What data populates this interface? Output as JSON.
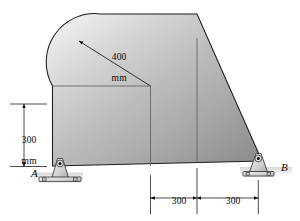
{
  "figure": {
    "kind": "engineering-statics-diagram"
  },
  "dimensions": {
    "radius": {
      "value": "400",
      "unit": "mm",
      "line1": "400",
      "line2": "mm",
      "type": "radius-leader"
    },
    "height_left": {
      "value": "300",
      "unit": "mm",
      "line1": "300",
      "line2": "mm",
      "type": "vertical"
    },
    "span_left": {
      "value": "300",
      "unit": "mm",
      "line1": "300",
      "line2": "mm",
      "type": "horizontal"
    },
    "span_right": {
      "value": "300",
      "unit": "mm",
      "line1": "300",
      "line2": "mm",
      "type": "horizontal"
    }
  },
  "points": {
    "a": "A",
    "b": "B"
  },
  "colors": {
    "outline": "#1a1a1a",
    "dimension_line": "#111111",
    "body_light": "#e8e8e8",
    "body_mid": "#b8b8b8",
    "body_dark": "#8f8f8f",
    "bracket_light": "#f0f0f0",
    "bracket_mid": "#c9c9c9",
    "ground_shadow": "#d9d9d9",
    "background": "#ffffff"
  }
}
